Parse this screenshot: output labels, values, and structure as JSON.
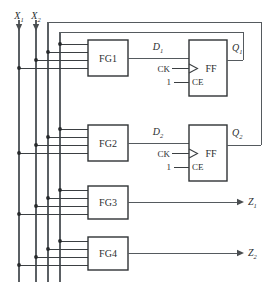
{
  "diagram": {
    "type": "logic-circuit-schematic",
    "colors": {
      "background": "#ffffff",
      "wire": "#555a5e",
      "block_border": "#2f3335",
      "text": "#2b2e30",
      "junction": "#26292b"
    }
  },
  "inputs": [
    {
      "id": "x1",
      "label": "X",
      "subscript": "1",
      "x": 19
    },
    {
      "id": "x2",
      "label": "X",
      "subscript": "2",
      "x": 36
    }
  ],
  "buses": [
    {
      "id": "bus-x1",
      "name": "X1",
      "x": 19
    },
    {
      "id": "bus-x2",
      "name": "X2",
      "x": 36
    },
    {
      "id": "bus-q2",
      "name": "Q2",
      "x": 48
    },
    {
      "id": "bus-q1",
      "name": "Q1",
      "x": 60
    }
  ],
  "blocks": [
    {
      "id": "fg1",
      "label": "FG1",
      "x": 88,
      "y": 40,
      "w": 40,
      "h": 36
    },
    {
      "id": "fg2",
      "label": "FG2",
      "x": 88,
      "y": 125,
      "w": 40,
      "h": 36
    },
    {
      "id": "fg3",
      "label": "FG3",
      "x": 88,
      "y": 186,
      "w": 40,
      "h": 33
    },
    {
      "id": "fg4",
      "label": "FG4",
      "x": 88,
      "y": 237,
      "w": 40,
      "h": 33
    }
  ],
  "flipflops": [
    {
      "id": "ff1",
      "label": "FF",
      "clock_label": "CK",
      "enable_label": "CE",
      "enable_value": "1",
      "data_label": "D",
      "data_subscript": "1",
      "out_label": "Q",
      "out_subscript": "1",
      "x": 189,
      "y": 40,
      "w": 38,
      "h": 56
    },
    {
      "id": "ff2",
      "label": "FF",
      "clock_label": "CK",
      "enable_label": "CE",
      "enable_value": "1",
      "data_label": "D",
      "data_subscript": "2",
      "out_label": "Q",
      "out_subscript": "2",
      "x": 189,
      "y": 125,
      "w": 38,
      "h": 56
    }
  ],
  "outputs": [
    {
      "id": "z1",
      "label": "Z",
      "subscript": "1",
      "x": 246,
      "y": 202
    },
    {
      "id": "z2",
      "label": "Z",
      "subscript": "2",
      "x": 246,
      "y": 253
    }
  ],
  "signal_labels": {
    "d1": {
      "text": "D",
      "sub": "1"
    },
    "d2": {
      "text": "D",
      "sub": "2"
    },
    "q1": {
      "text": "Q",
      "sub": "1"
    },
    "q2": {
      "text": "Q",
      "sub": "2"
    },
    "z1": {
      "text": "Z",
      "sub": "1"
    },
    "z2": {
      "text": "Z",
      "sub": "2"
    },
    "x1": {
      "text": "X",
      "sub": "1"
    },
    "x2": {
      "text": "X",
      "sub": "2"
    },
    "ck": {
      "text": "CK"
    },
    "ce": {
      "text": "CE"
    },
    "one": {
      "text": "1"
    },
    "ff": {
      "text": "FF"
    }
  }
}
